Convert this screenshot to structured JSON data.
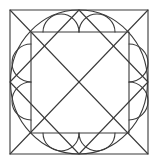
{
  "diagram": {
    "title": "",
    "stroke_color": "#3a3a3a",
    "stroke_width": 1.1,
    "background": "#ffffff",
    "outer_rect": {
      "x": 10,
      "y": 10,
      "w": 138,
      "h": 144
    },
    "inner_square": {
      "x": 31,
      "y": 32,
      "w": 98,
      "h": 101
    },
    "circle": {
      "cx": 79,
      "cy": 82,
      "rx": 68.5,
      "ry": 72
    },
    "diamond": [
      [
        79,
        10
      ],
      [
        148,
        82
      ],
      [
        79,
        154
      ],
      [
        10,
        82
      ]
    ],
    "diagonals": [
      {
        "x1": 10,
        "y1": 10,
        "x2": 148,
        "y2": 154
      },
      {
        "x1": 148,
        "y1": 10,
        "x2": 10,
        "y2": 154
      }
    ],
    "scallop_arcs": [
      {
        "side": "top",
        "from": [
          43,
          32
        ],
        "to": [
          79,
          32
        ],
        "bulge": "up"
      },
      {
        "side": "top",
        "from": [
          79,
          32
        ],
        "to": [
          115,
          32
        ],
        "bulge": "up"
      },
      {
        "side": "bottom",
        "from": [
          43,
          133
        ],
        "to": [
          79,
          133
        ],
        "bulge": "down"
      },
      {
        "side": "bottom",
        "from": [
          79,
          133
        ],
        "to": [
          115,
          133
        ],
        "bulge": "down"
      },
      {
        "side": "left",
        "from": [
          31,
          44
        ],
        "to": [
          31,
          82
        ],
        "bulge": "left"
      },
      {
        "side": "left",
        "from": [
          31,
          82
        ],
        "to": [
          31,
          120
        ],
        "bulge": "left"
      },
      {
        "side": "right",
        "from": [
          129,
          44
        ],
        "to": [
          129,
          82
        ],
        "bulge": "right"
      },
      {
        "side": "right",
        "from": [
          129,
          82
        ],
        "to": [
          129,
          120
        ],
        "bulge": "right"
      }
    ],
    "labels": []
  }
}
